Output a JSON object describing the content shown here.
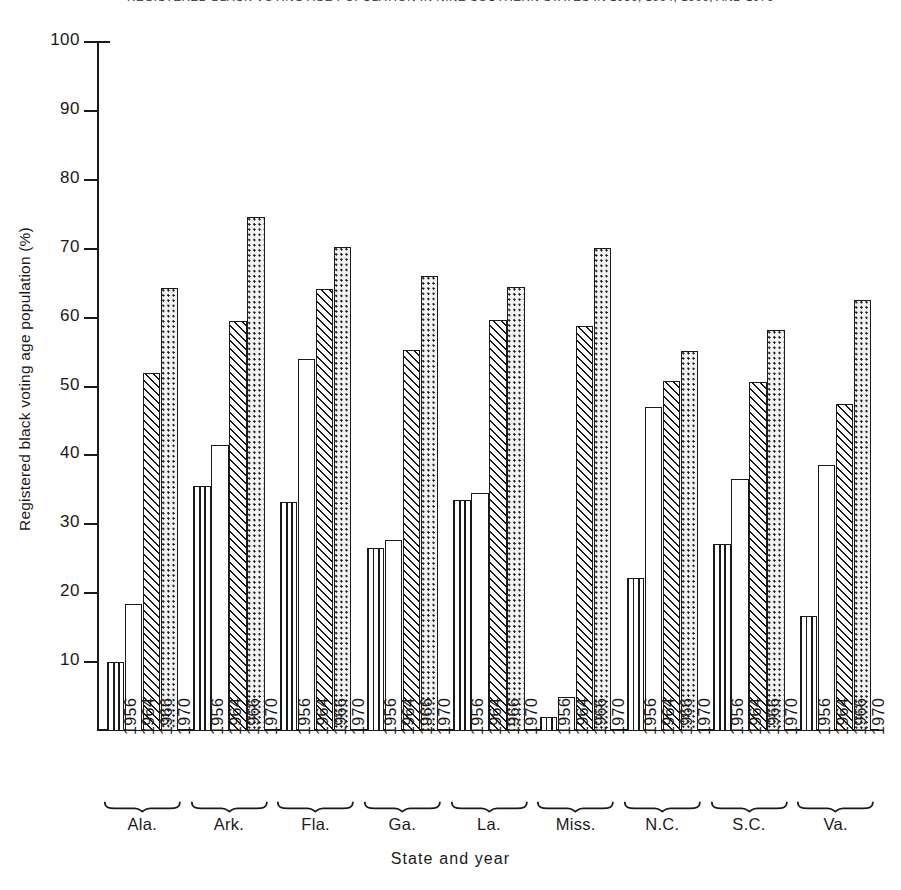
{
  "chart_data": {
    "type": "bar",
    "title": "REGISTERED BLACK VOTING AGE POPULATION IN NINE SOUTHERN STATES IN 1956, 1964, 1966, AND 1970",
    "xlabel": "State and year",
    "ylabel": "Registered black voting age population (%)",
    "ylim": [
      0,
      100
    ],
    "yticks": [
      10,
      20,
      30,
      40,
      50,
      60,
      70,
      80,
      90,
      100
    ],
    "grid": false,
    "legend": "none",
    "categories": [
      "Ala.",
      "Ark.",
      "Fla.",
      "Ga.",
      "La.",
      "Miss.",
      "N.C.",
      "S.C.",
      "Va."
    ],
    "years": [
      "1956",
      "1964",
      "1966",
      "1970"
    ],
    "series": [
      {
        "name": "1956",
        "pattern": "vertical-lines",
        "values": [
          10.0,
          35.5,
          33.2,
          26.5,
          33.5,
          2.0,
          22.2,
          27.1,
          16.7
        ]
      },
      {
        "name": "1964",
        "pattern": "blank",
        "values": [
          18.4,
          41.5,
          54.0,
          27.7,
          34.5,
          5.0,
          47.0,
          36.6,
          38.6
        ]
      },
      {
        "name": "1966",
        "pattern": "diagonal-hatch",
        "values": [
          52.0,
          59.5,
          64.2,
          55.3,
          59.6,
          58.8,
          50.8,
          50.7,
          47.4
        ]
      },
      {
        "name": "1970",
        "pattern": "dotted",
        "values": [
          64.3,
          74.6,
          70.2,
          66.1,
          64.4,
          70.1,
          55.1,
          58.2,
          62.6
        ]
      }
    ],
    "data_points": [
      {
        "state": "Ala.",
        "year": "1956",
        "value": 10.0
      },
      {
        "state": "Ala.",
        "year": "1964",
        "value": 18.4
      },
      {
        "state": "Ala.",
        "year": "1966",
        "value": 52.0
      },
      {
        "state": "Ala.",
        "year": "1970",
        "value": 64.3
      },
      {
        "state": "Ark.",
        "year": "1956",
        "value": 35.5
      },
      {
        "state": "Ark.",
        "year": "1964",
        "value": 41.5
      },
      {
        "state": "Ark.",
        "year": "1966",
        "value": 59.5
      },
      {
        "state": "Ark.",
        "year": "1970",
        "value": 74.6
      },
      {
        "state": "Fla.",
        "year": "1956",
        "value": 33.2
      },
      {
        "state": "Fla.",
        "year": "1964",
        "value": 54.0
      },
      {
        "state": "Fla.",
        "year": "1966",
        "value": 64.2
      },
      {
        "state": "Fla.",
        "year": "1970",
        "value": 70.2
      },
      {
        "state": "Ga.",
        "year": "1956",
        "value": 26.5
      },
      {
        "state": "Ga.",
        "year": "1964",
        "value": 27.7
      },
      {
        "state": "Ga.",
        "year": "1966",
        "value": 55.3
      },
      {
        "state": "Ga.",
        "year": "1970",
        "value": 66.1
      },
      {
        "state": "La.",
        "year": "1956",
        "value": 33.5
      },
      {
        "state": "La.",
        "year": "1964",
        "value": 34.5
      },
      {
        "state": "La.",
        "year": "1966",
        "value": 59.6
      },
      {
        "state": "La.",
        "year": "1970",
        "value": 64.4
      },
      {
        "state": "Miss.",
        "year": "1956",
        "value": 2.0
      },
      {
        "state": "Miss.",
        "year": "1964",
        "value": 5.0
      },
      {
        "state": "Miss.",
        "year": "1966",
        "value": 58.8
      },
      {
        "state": "Miss.",
        "year": "1970",
        "value": 70.1
      },
      {
        "state": "N.C.",
        "year": "1956",
        "value": 22.2
      },
      {
        "state": "N.C.",
        "year": "1964",
        "value": 47.0
      },
      {
        "state": "N.C.",
        "year": "1966",
        "value": 50.8
      },
      {
        "state": "N.C.",
        "year": "1970",
        "value": 55.1
      },
      {
        "state": "S.C.",
        "year": "1956",
        "value": 27.1
      },
      {
        "state": "S.C.",
        "year": "1964",
        "value": 36.6
      },
      {
        "state": "S.C.",
        "year": "1966",
        "value": 50.7
      },
      {
        "state": "S.C.",
        "year": "1970",
        "value": 58.2
      },
      {
        "state": "Va.",
        "year": "1956",
        "value": 16.7
      },
      {
        "state": "Va.",
        "year": "1964",
        "value": 38.6
      },
      {
        "state": "Va.",
        "year": "1966",
        "value": 47.4
      },
      {
        "state": "Va.",
        "year": "1970",
        "value": 62.6
      }
    ]
  },
  "colors": {
    "ink": "#1a1a1a",
    "background": "#ffffff",
    "dot_fill": "#f2f2f2"
  }
}
